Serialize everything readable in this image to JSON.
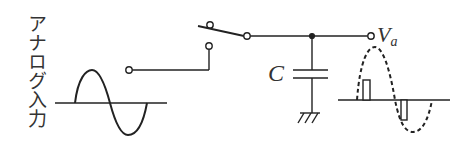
{
  "diagram": {
    "input_label": "アナログ入力",
    "capacitor_label": "C",
    "output_label": "V",
    "output_label_subscript": "a",
    "colors": {
      "stroke": "#222222",
      "text": "#333333",
      "background": "#ffffff"
    },
    "components": [
      {
        "type": "input-sine-wave",
        "style": "solid"
      },
      {
        "type": "input-terminal"
      },
      {
        "type": "switch",
        "state": "open-to-upper-contact"
      },
      {
        "type": "junction-node"
      },
      {
        "type": "capacitor",
        "label": "C"
      },
      {
        "type": "ground"
      },
      {
        "type": "output-terminal",
        "label": "Va"
      },
      {
        "type": "sampled-output-waveform",
        "style": "dashed-sine-with-pulses",
        "pulses": [
          "positive",
          "negative"
        ]
      }
    ]
  }
}
